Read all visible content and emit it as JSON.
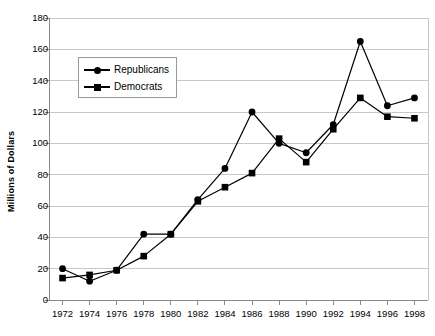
{
  "chart_data": {
    "type": "line",
    "title": "",
    "xlabel": "",
    "ylabel": "Millions of Dollars",
    "x": [
      1972,
      1974,
      1976,
      1978,
      1980,
      1982,
      1984,
      1986,
      1988,
      1990,
      1992,
      1994,
      1996,
      1998
    ],
    "categories": [
      "1972",
      "1974",
      "1976",
      "1978",
      "1980",
      "1982",
      "1984",
      "1986",
      "1988",
      "1990",
      "1992",
      "1994",
      "1996",
      "1998"
    ],
    "series": [
      {
        "name": "Republicans",
        "marker": "circle",
        "color": "#000000",
        "values": [
          20,
          12,
          19,
          42,
          42,
          64,
          84,
          120,
          100,
          94,
          112,
          165,
          124,
          129
        ]
      },
      {
        "name": "Democrats",
        "marker": "square",
        "color": "#000000",
        "values": [
          14,
          16,
          19,
          28,
          42,
          63,
          72,
          81,
          103,
          88,
          109,
          129,
          117,
          116
        ]
      }
    ],
    "ylim": [
      0,
      180
    ],
    "yticks": [
      0,
      20,
      40,
      60,
      80,
      100,
      120,
      140,
      160,
      180
    ],
    "ytick_labels": [
      "0",
      "20",
      "40",
      "60",
      "80",
      "100",
      "120",
      "140",
      "160",
      "180"
    ],
    "xlim": [
      1971,
      1999
    ],
    "xticks": [
      1972,
      1974,
      1976,
      1978,
      1980,
      1982,
      1984,
      1986,
      1988,
      1990,
      1992,
      1994,
      1996,
      1998
    ],
    "grid": "horizontal",
    "grid_color": "#c8c8c8",
    "axis_color": "#888888",
    "legend": {
      "position": "upper-left-inset",
      "entries": [
        {
          "label": "Republicans",
          "marker": "circle"
        },
        {
          "label": "Democrats",
          "marker": "square"
        }
      ]
    }
  }
}
